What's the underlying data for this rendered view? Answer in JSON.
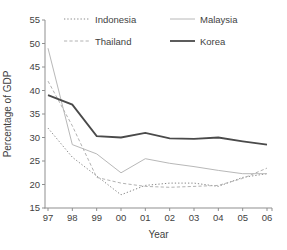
{
  "chart_data": {
    "type": "line",
    "x": [
      "97",
      "98",
      "99",
      "00",
      "01",
      "02",
      "03",
      "04",
      "05",
      "06"
    ],
    "xlabel": "Year",
    "ylabel": "Percentage of GDP",
    "ylim": [
      15,
      55
    ],
    "ytick_step": 5,
    "yticks": [
      15,
      20,
      25,
      30,
      35,
      40,
      45,
      50,
      55
    ],
    "grid": false,
    "legend_position": "top",
    "axis_color": "#8f8f8f",
    "text_color": "#3f3f3f",
    "series": [
      {
        "name": "Indonesia",
        "style": "dotted",
        "color": "#878787",
        "width": 1,
        "values": [
          32,
          25.8,
          21.8,
          17.8,
          19.8,
          20.3,
          20.3,
          19.6,
          21.5,
          22.3
        ]
      },
      {
        "name": "Thailand",
        "style": "dashed",
        "color": "#b2b2b2",
        "width": 1,
        "values": [
          42,
          32.5,
          21.5,
          20.3,
          19.6,
          19.4,
          19.6,
          19.8,
          21.3,
          23.5
        ]
      },
      {
        "name": "Malaysia",
        "style": "solid",
        "color": "#b8b8b8",
        "width": 1,
        "values": [
          49,
          28.5,
          26.5,
          22.5,
          25.5,
          24.5,
          23.8,
          23,
          22.3,
          22.3
        ]
      },
      {
        "name": "Korea",
        "style": "solid",
        "color": "#4a4a4a",
        "width": 1.8,
        "values": [
          39,
          37,
          30.3,
          30,
          31,
          29.8,
          29.7,
          30,
          29.2,
          28.5
        ]
      }
    ]
  }
}
